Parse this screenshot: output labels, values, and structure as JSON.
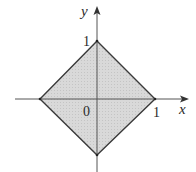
{
  "diagram": {
    "type": "coordinate-region",
    "axes": {
      "x_label": "x",
      "y_label": "y",
      "origin_label": "0"
    },
    "ticks": {
      "x_tick_label": "1",
      "y_tick_label": "1"
    },
    "region": {
      "vertices": [
        [
          1,
          0
        ],
        [
          0,
          1
        ],
        [
          -1,
          0
        ],
        [
          0,
          -1
        ]
      ],
      "fill_color": "#d6d6d6",
      "stroke_color": "#3a3a3a"
    },
    "axis_color": "#555555"
  }
}
